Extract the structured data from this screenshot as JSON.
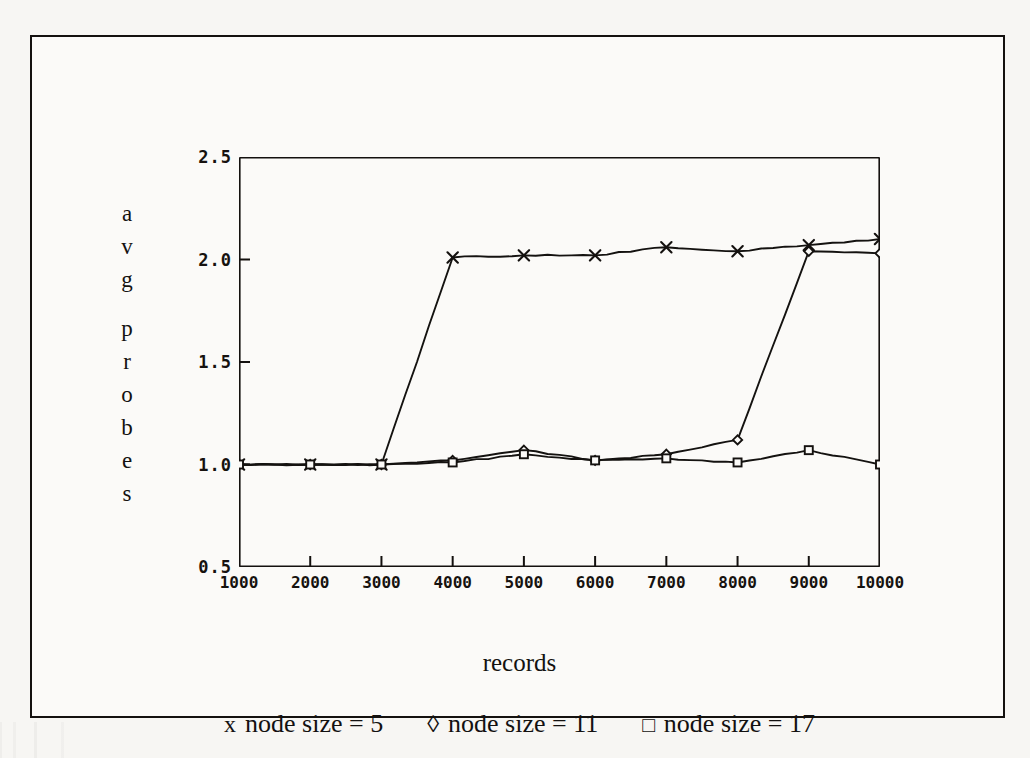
{
  "chart_data": {
    "type": "line",
    "title": "",
    "xlabel": "records",
    "ylabel": "avg probes",
    "ylabel_chars": [
      "a",
      "v",
      "g",
      "",
      "p",
      "r",
      "o",
      "b",
      "e",
      "s"
    ],
    "x": [
      1000,
      2000,
      3000,
      4000,
      5000,
      6000,
      7000,
      8000,
      9000,
      10000
    ],
    "xlim": [
      1000,
      10000
    ],
    "ylim": [
      0.5,
      2.5
    ],
    "xticks": [
      "1000",
      "2000",
      "3000",
      "4000",
      "5000",
      "6000",
      "7000",
      "8000",
      "9000",
      "10000"
    ],
    "yticks": [
      "2.5",
      "2.0",
      "1.5",
      "1.0",
      "0.5"
    ],
    "ytick_values": [
      2.5,
      2.0,
      1.5,
      1.0,
      0.5
    ],
    "grid": false,
    "legend_position": "below",
    "series": [
      {
        "name": "node size = 5",
        "marker": "x",
        "marker_glyph": "×",
        "color": "#141210",
        "values": [
          1.0,
          1.0,
          1.0,
          2.01,
          2.02,
          2.02,
          2.06,
          2.04,
          2.07,
          2.1
        ]
      },
      {
        "name": "node size = 11",
        "marker": "diamond",
        "marker_glyph": "◊",
        "color": "#141210",
        "values": [
          1.0,
          1.0,
          1.0,
          1.02,
          1.07,
          1.02,
          1.05,
          1.12,
          2.04,
          2.03
        ]
      },
      {
        "name": "node size = 17",
        "marker": "square",
        "marker_glyph": "□",
        "color": "#141210",
        "values": [
          1.0,
          1.0,
          1.0,
          1.01,
          1.05,
          1.02,
          1.03,
          1.01,
          1.07,
          1.0
        ]
      }
    ]
  },
  "legend": {
    "entries": [
      {
        "marker": "x",
        "marker_glyph": "x",
        "label": "node size = 5"
      },
      {
        "marker": "diamond",
        "marker_glyph": "◊",
        "label": "node size = 11"
      },
      {
        "marker": "square",
        "marker_glyph": "□",
        "label": "node size = 17"
      }
    ]
  },
  "axes": {
    "x_title": "records",
    "y_title": "avg probes"
  }
}
